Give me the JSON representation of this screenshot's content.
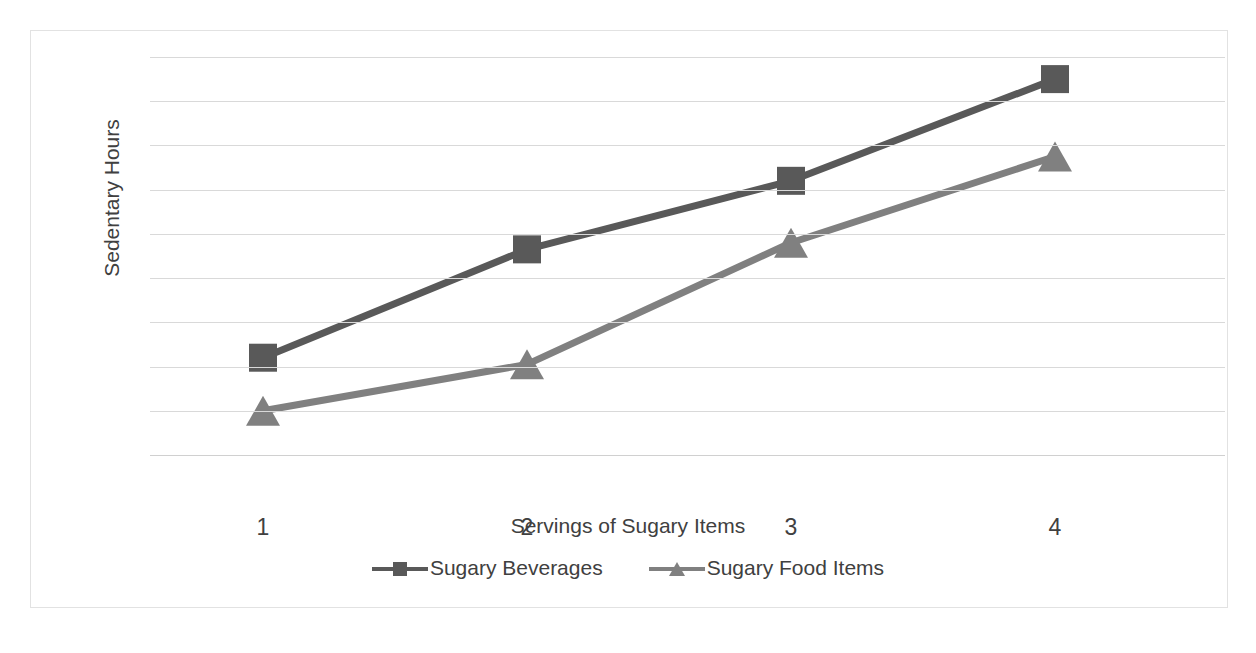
{
  "chart_data": {
    "type": "line",
    "title": "",
    "xlabel": "Servings of Sugary Items",
    "ylabel": "Sedentary Hours",
    "categories": [
      "1",
      "2",
      "3",
      "4"
    ],
    "x": [
      1,
      2,
      3,
      4
    ],
    "xlim": [
      1,
      4
    ],
    "ylim": [
      0,
      9
    ],
    "y_ticks": [
      "9",
      "8",
      "7",
      "6",
      "5",
      "4",
      "3",
      "2",
      "1",
      "0"
    ],
    "y_tick_values": [
      9,
      8,
      7,
      6,
      5,
      4,
      3,
      2,
      1,
      0
    ],
    "grid": true,
    "legend_position": "bottom",
    "series": [
      {
        "name": "Sugary Beverages",
        "marker": "square",
        "color": "#595959",
        "values": [
          2.2,
          4.65,
          6.2,
          8.5
        ]
      },
      {
        "name": "Sugary Food Items",
        "marker": "triangle",
        "color": "#808080",
        "values": [
          1.0,
          2.05,
          4.8,
          6.75
        ]
      }
    ]
  },
  "chart": {
    "title_clipped": "",
    "y_axis_title": "Sedentary Hours",
    "x_axis_title": "Servings of Sugary Items",
    "y_ticks": [
      "9",
      "8",
      "7",
      "6",
      "5",
      "4",
      "3",
      "2",
      "1",
      "0"
    ],
    "x_ticks": [
      "1",
      "2",
      "3",
      "4"
    ],
    "legend": [
      {
        "label": "Sugary Beverages",
        "color": "#595959",
        "marker": "square-marker"
      },
      {
        "label": "Sugary Food Items",
        "color": "#808080",
        "marker": "triangle-marker"
      }
    ]
  }
}
